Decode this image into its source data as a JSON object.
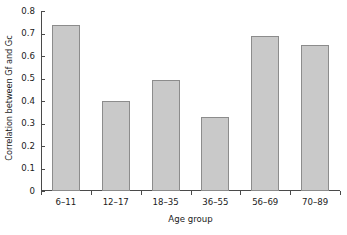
{
  "chart_data": {
    "type": "bar",
    "title": "",
    "xlabel": "Age group",
    "ylabel": "Correlation between Gf and Gc",
    "categories": [
      "6–11",
      "12–17",
      "18–35",
      "36–55",
      "56–69",
      "70–89"
    ],
    "values": [
      0.74,
      0.4,
      0.495,
      0.33,
      0.69,
      0.65
    ],
    "ylim": [
      0,
      0.8
    ],
    "ytick_labels": [
      "0.8",
      "0.7",
      "0.6",
      "0.5",
      "0.4",
      "0.3",
      "0.2",
      "0.1",
      "0"
    ],
    "ytick_values": [
      0.8,
      0.7,
      0.6,
      0.5,
      0.4,
      0.3,
      0.2,
      0.1,
      0
    ],
    "grid": false,
    "legend": null,
    "bar_fill_color": "#c9c9c9",
    "bar_edge_color": "#8c8c8c",
    "axis_color": "#4a4a4a",
    "background_color": "#ffffff"
  }
}
